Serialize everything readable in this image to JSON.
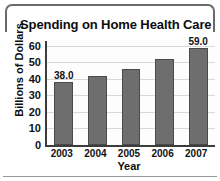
{
  "chart_data": {
    "type": "bar",
    "title": "Spending on Home Health Care",
    "xlabel": "Year",
    "ylabel": "Billions of Dollars",
    "categories": [
      "2003",
      "2004",
      "2005",
      "2006",
      "2007"
    ],
    "values": [
      38.0,
      42.0,
      46.0,
      52.0,
      59.0
    ],
    "point_labels": [
      "38.0",
      "",
      "",
      "",
      "59.0"
    ],
    "yticks": [
      0,
      10,
      20,
      30,
      40,
      50,
      60
    ],
    "ytick_labels": [
      "0",
      "10",
      "20",
      "30",
      "40",
      "50",
      "60"
    ],
    "ylim": [
      0,
      63
    ],
    "grid": true,
    "legend": false,
    "bar_color": "#6e6e6e",
    "bar_edge_color": "#4a4a4a",
    "axis_color": "#3c3c3c",
    "grid_color": "#d8d8d8",
    "plot_background": "#fdfdfd",
    "text_color": "#111111",
    "frame_color": "#6a6a6a"
  }
}
